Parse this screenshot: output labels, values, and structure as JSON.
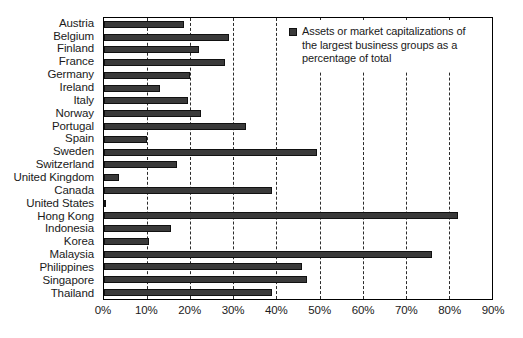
{
  "chart_data": {
    "type": "bar",
    "orientation": "horizontal",
    "title": "",
    "xlabel": "",
    "ylabel": "",
    "xlim": [
      0,
      90
    ],
    "grid": true,
    "grid_style": "dashed vertical",
    "legend_position": "top-right",
    "legend": [
      "Assets or market capitalizations of the largest business groups as a percentage of total"
    ],
    "xticks": [
      "0%",
      "10%",
      "20%",
      "30%",
      "40%",
      "50%",
      "60%",
      "70%",
      "80%",
      "90%"
    ],
    "xtick_values": [
      0,
      10,
      20,
      30,
      40,
      50,
      60,
      70,
      80,
      90
    ],
    "categories": [
      "Austria",
      "Belgium",
      "Finland",
      "France",
      "Germany",
      "Ireland",
      "Italy",
      "Norway",
      "Portugal",
      "Spain",
      "Sweden",
      "Switzerland",
      "United Kingdom",
      "Canada",
      "United States",
      "Hong Kong",
      "Indonesia",
      "Korea",
      "Malaysia",
      "Philippines",
      "Singapore",
      "Thailand"
    ],
    "values": [
      18.5,
      29,
      22,
      28,
      20,
      13,
      19.5,
      22.5,
      33,
      10,
      49.5,
      17,
      3.5,
      39,
      0.5,
      82,
      15.5,
      10.5,
      76,
      46,
      47,
      39
    ],
    "series": [
      {
        "name": "Assets or market capitalizations of the largest business groups as a percentage of total",
        "values": [
          18.5,
          29,
          22,
          28,
          20,
          13,
          19.5,
          22.5,
          33,
          10,
          49.5,
          17,
          3.5,
          39,
          0.5,
          82,
          15.5,
          10.5,
          76,
          46,
          47,
          39
        ]
      }
    ],
    "colors": {
      "bar_fill": "#3a3a3a",
      "bar_edge": "#111111",
      "grid": "#2b2b2b",
      "axis": "#000000",
      "text": "#1a1a1a",
      "background": "#ffffff"
    }
  },
  "legend": {
    "label": "Assets or market capitalizations of the largest business groups as a percentage of total",
    "swatch_icon": "legend-square-icon"
  }
}
